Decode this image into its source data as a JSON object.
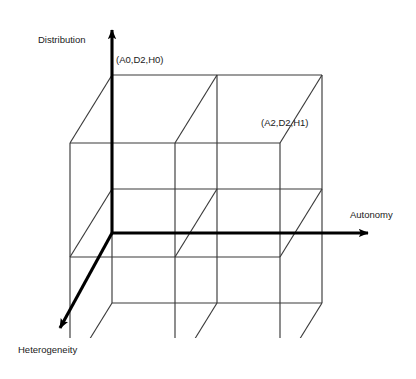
{
  "figure": {
    "type": "3d-design-space-cube",
    "background": "#ffffff",
    "line_color": "#333333",
    "axis_color": "#000000"
  },
  "axes": [
    {
      "id": "distribution",
      "label": "Distribution",
      "direction": "up",
      "label_x": 38,
      "label_y": 34
    },
    {
      "id": "autonomy",
      "label": "Autonomy",
      "direction": "right",
      "label_x": 350,
      "label_y": 209
    },
    {
      "id": "heterogeneity",
      "label": "Heterogeneity",
      "direction": "down-left",
      "label_x": 18,
      "label_y": 344
    }
  ],
  "origin": {
    "x": 112,
    "y": 233
  },
  "vertex_labels": [
    {
      "id": "a0d2h0",
      "text": "(A0,D2,H0)",
      "x": 116,
      "y": 54
    },
    {
      "id": "a2d2h1",
      "text": "(A2,D2,H1)",
      "x": 261,
      "y": 117
    }
  ],
  "cube": {
    "front_left_x": 112,
    "front_right_x": 287,
    "front_top_y": 75,
    "front_bottom_y": 303,
    "depth_dx": -42,
    "depth_dy": 68,
    "divisions": 2
  },
  "caption": {
    "text": ""
  }
}
